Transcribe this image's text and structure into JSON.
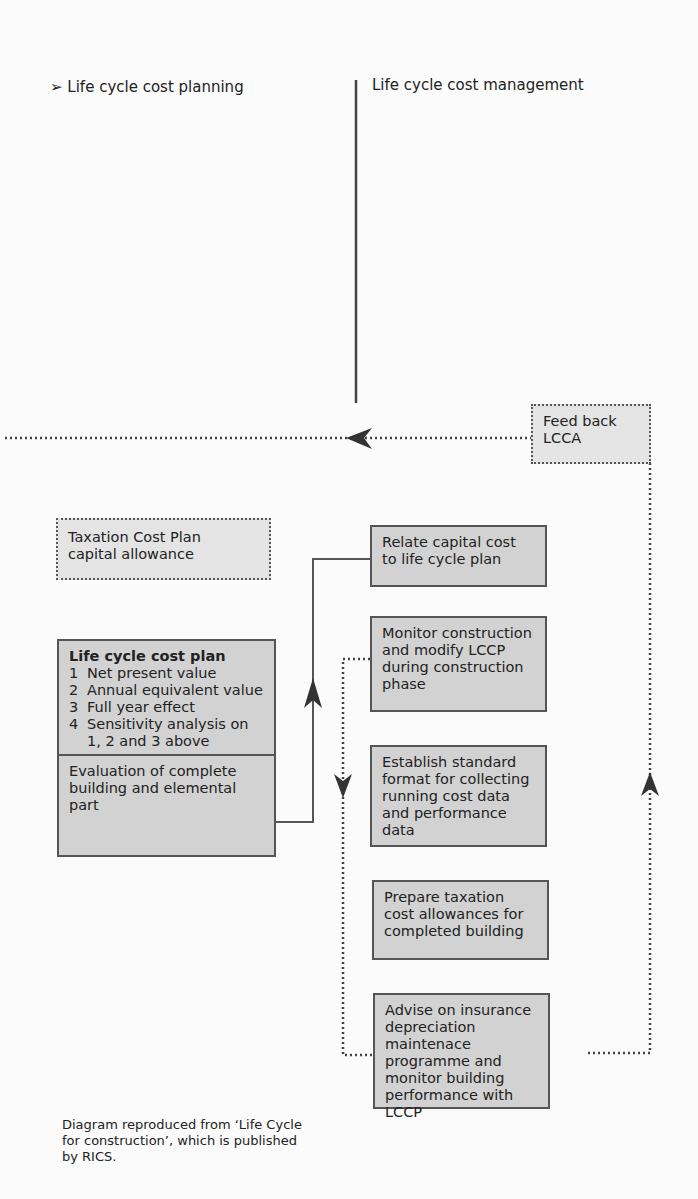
{
  "headings": {
    "left": "➢ Life cycle cost planning",
    "right": "Life cycle cost management"
  },
  "boxes": {
    "feedback": {
      "lines": [
        "Feed back",
        "LCCA"
      ]
    },
    "taxation_plan": {
      "lines": [
        "Taxation Cost Plan",
        "capital allowance"
      ]
    },
    "lccp": {
      "title": "Life cycle cost plan",
      "items": [
        {
          "num": "1",
          "text": "Net present value"
        },
        {
          "num": "2",
          "text": "Annual equivalent value"
        },
        {
          "num": "3",
          "text": "Full year effect"
        },
        {
          "num": "4",
          "text": "Sensitivity analysis on 1, 2 and 3 above"
        }
      ],
      "footer": "Evaluation of complete building and elemental part"
    },
    "relate": {
      "text": "Relate capital cost to life cycle plan"
    },
    "monitor": {
      "text": "Monitor construction and modify LCCP during construction phase"
    },
    "establish": {
      "text": "Establish standard format for collecting running cost data and performance data"
    },
    "prepare": {
      "text": "Prepare taxation cost allowances for completed building"
    },
    "advise": {
      "text": "Advise on insurance depreciation maintenace programme and monitor building performance with LCCP"
    }
  },
  "caption": "Diagram reproduced from ‘Life Cycle for construction’, which is published by RICS.",
  "colors": {
    "box_fill": "#d2d2d2",
    "dotted_box_fill": "#e4e4e4",
    "line": "#555555",
    "arrow": "#333333"
  }
}
